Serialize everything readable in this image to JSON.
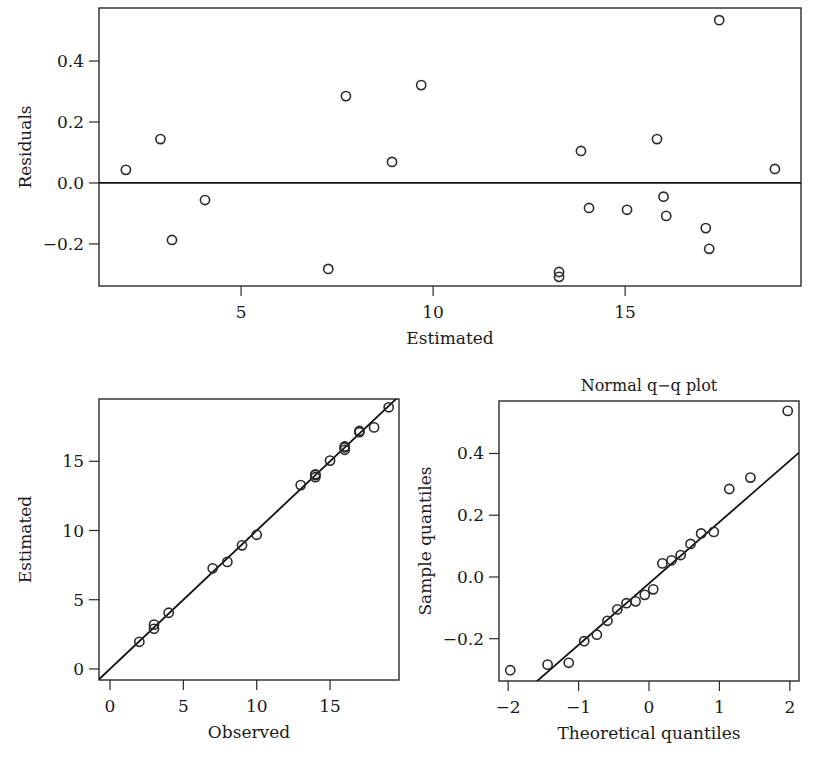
{
  "chart_data": [
    {
      "id": "residuals",
      "type": "scatter",
      "title": "",
      "xlabel": "Estimated",
      "ylabel": "Residuals",
      "xlim": [
        1.3,
        19.58
      ],
      "ylim": [
        -0.338,
        0.574
      ],
      "xticks": [
        5,
        10,
        15
      ],
      "xtick_labels": [
        "5",
        "10",
        "15"
      ],
      "yticks": [
        -0.2,
        0.0,
        0.2,
        0.4
      ],
      "ytick_labels": [
        "−0.2",
        "0.0",
        "0.2",
        "0.4"
      ],
      "grid": false,
      "reference_line": {
        "type": "horizontal",
        "y": 0.0
      },
      "frame": {
        "left": 99,
        "top": 8,
        "right": 801,
        "bottom": 286
      },
      "x": [
        2.0,
        2.9,
        3.2,
        4.06,
        7.27,
        7.73,
        8.93,
        9.69,
        13.28,
        13.28,
        13.85,
        14.06,
        15.05,
        15.83,
        16.0,
        16.07,
        17.1,
        17.19,
        17.45,
        18.9
      ],
      "y": [
        0.043,
        0.144,
        -0.187,
        -0.056,
        -0.282,
        0.285,
        0.069,
        0.321,
        -0.292,
        -0.308,
        0.105,
        -0.082,
        -0.088,
        0.144,
        -0.045,
        -0.108,
        -0.148,
        -0.216,
        0.534,
        0.046
      ]
    },
    {
      "id": "observed-vs-estimated",
      "type": "scatter",
      "title": "",
      "xlabel": "Observed",
      "ylabel": "Estimated",
      "xlim": [
        -0.75,
        19.7
      ],
      "ylim": [
        -0.8,
        19.5
      ],
      "xticks": [
        0,
        5,
        10,
        15
      ],
      "xtick_labels": [
        "0",
        "5",
        "10",
        "15"
      ],
      "yticks": [
        0,
        5,
        10,
        15
      ],
      "ytick_labels": [
        "0",
        "5",
        "10",
        "15"
      ],
      "grid": false,
      "reference_line": {
        "type": "identity",
        "slope": 1,
        "intercept": 0
      },
      "frame": {
        "left": 99,
        "top": 399,
        "right": 399,
        "bottom": 680
      },
      "x": [
        2,
        3,
        3,
        4,
        7,
        8,
        9,
        10,
        13,
        14,
        14,
        14,
        15,
        16,
        16,
        16,
        17,
        17,
        18,
        19
      ],
      "y": [
        1.96,
        2.9,
        3.2,
        4.06,
        7.27,
        7.73,
        8.93,
        9.69,
        13.28,
        13.85,
        14.06,
        14.0,
        15.05,
        15.83,
        16.0,
        16.07,
        17.1,
        17.19,
        17.45,
        18.9
      ]
    },
    {
      "id": "normal-qq",
      "type": "scatter",
      "title": "Normal q−q plot",
      "xlabel": "Theoretical quantiles",
      "ylabel": "Sample quantiles",
      "xlim": [
        -2.13,
        2.13
      ],
      "ylim": [
        -0.337,
        0.57
      ],
      "xticks": [
        -2,
        -1,
        0,
        1,
        2
      ],
      "xtick_labels": [
        "−2",
        "−1",
        "0",
        "1",
        "2"
      ],
      "yticks": [
        -0.2,
        0.0,
        0.2,
        0.4
      ],
      "ytick_labels": [
        "−0.2",
        "0.0",
        "0.2",
        "0.4"
      ],
      "grid": false,
      "reference_line": {
        "type": "qq-line",
        "slope": 0.199,
        "intercept": -0.021
      },
      "frame": {
        "left": 499,
        "top": 401,
        "right": 799,
        "bottom": 681
      },
      "x": [
        -1.97,
        -1.44,
        -1.14,
        -0.92,
        -0.74,
        -0.59,
        -0.45,
        -0.32,
        -0.19,
        -0.06,
        0.06,
        0.19,
        0.32,
        0.45,
        0.59,
        0.74,
        0.92,
        1.14,
        1.44,
        1.97
      ],
      "y": [
        -0.302,
        -0.284,
        -0.278,
        -0.208,
        -0.187,
        -0.142,
        -0.105,
        -0.085,
        -0.079,
        -0.058,
        -0.04,
        0.044,
        0.054,
        0.071,
        0.107,
        0.141,
        0.146,
        0.285,
        0.322,
        0.538
      ]
    }
  ]
}
